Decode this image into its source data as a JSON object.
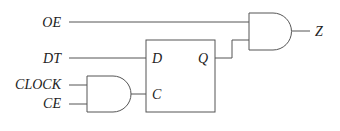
{
  "diagram": {
    "type": "logic-circuit",
    "inputs": [
      {
        "label": "OE"
      },
      {
        "label": "DT"
      },
      {
        "label": "CLOCK"
      },
      {
        "label": "CE"
      }
    ],
    "flipflop": {
      "pins": {
        "d": "D",
        "c": "C",
        "q": "Q"
      }
    },
    "gates": [
      {
        "name": "and-gate-enable",
        "type": "AND",
        "inputs": [
          "CLOCK",
          "CE"
        ],
        "output": "C"
      },
      {
        "name": "and-gate-output",
        "type": "AND",
        "inputs": [
          "OE",
          "Q"
        ],
        "output": "Z"
      }
    ],
    "output": {
      "label": "Z"
    },
    "colors": {
      "line": "#555555",
      "text": "#222222",
      "background": "#ffffff"
    }
  }
}
